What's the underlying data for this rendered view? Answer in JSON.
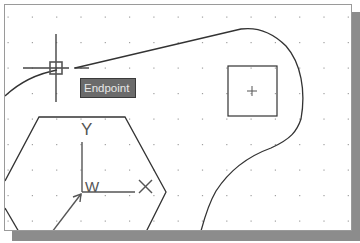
{
  "app": "CAD drawing viewport",
  "osnap": {
    "tooltip_label": "Endpoint",
    "marker": "endpoint-snap-marker",
    "cursor": "crosshair-cursor"
  },
  "ucs_icon": {
    "x_label": "X",
    "y_label": "Y",
    "w_label": "W",
    "name": "world-ucs-icon"
  },
  "grid": {
    "spacing_px": 24.3,
    "visible": true
  },
  "objects": [
    {
      "type": "polyline-curve",
      "name": "spline-boundary"
    },
    {
      "type": "rectangle",
      "name": "square-with-center-mark"
    },
    {
      "type": "polygon",
      "name": "hexagon"
    }
  ],
  "colors": {
    "background": "#ffffff",
    "geometry": "#333333",
    "grid_dot": "#9a9a9a",
    "tooltip_bg": "#6b6b6b",
    "tooltip_text": "#e8e8e8",
    "shadow": "#8c8c8c"
  }
}
